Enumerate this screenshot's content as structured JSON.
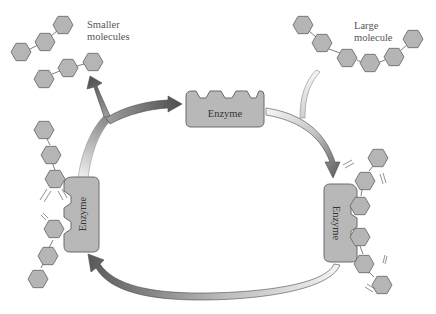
{
  "diagram": {
    "labels": {
      "smaller_line1": "Smaller",
      "smaller_line2": "molecules",
      "large_line1": "Large",
      "large_line2": "molecule",
      "enzyme_top": "Enzyme",
      "enzyme_left": "Enzyme",
      "enzyme_right": "Enzyme"
    },
    "colors": {
      "hexagon_fill": "#b5b5b5",
      "hexagon_stroke": "#6e6e6e",
      "enzyme_fill": "#b8b8b8",
      "arrow_dark": "#555555",
      "arrow_light": "#f0f0f0",
      "background": "#ffffff"
    },
    "nodes": [
      {
        "id": "large-molecule",
        "label": "Large molecule",
        "subunits": 6
      },
      {
        "id": "enzyme-free",
        "label": "Enzyme"
      },
      {
        "id": "enzyme-substrate-complex",
        "label": "Enzyme",
        "bound_subunits": 2
      },
      {
        "id": "enzyme-product-complex",
        "label": "Enzyme"
      },
      {
        "id": "smaller-molecules",
        "label": "Smaller molecules",
        "chains": 2,
        "subunits_per_chain": 3
      }
    ],
    "edges": [
      {
        "from": "enzyme-free",
        "to": "enzyme-substrate-complex",
        "note": "joined by large molecule"
      },
      {
        "from": "enzyme-substrate-complex",
        "to": "enzyme-product-complex"
      },
      {
        "from": "enzyme-product-complex",
        "to": "enzyme-free",
        "note": "releases smaller molecules"
      }
    ]
  }
}
